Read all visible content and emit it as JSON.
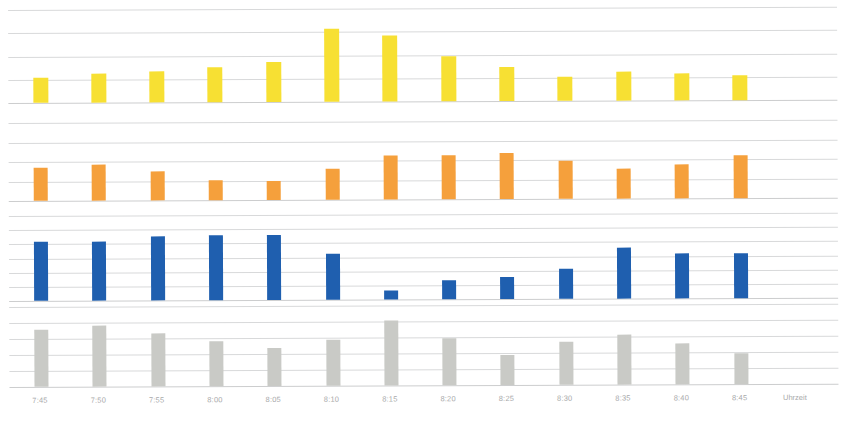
{
  "chart_data": {
    "type": "bar",
    "title": "",
    "subtitle": "",
    "xlabel": "Uhrzeit",
    "ylabel": "",
    "grid": true,
    "legend_position": "none",
    "orientation": "vertical",
    "panel_layout": "4 stacked panels sharing one time axis",
    "categories": [
      "7:45",
      "7:50",
      "7:55",
      "8:00",
      "8:05",
      "8:10",
      "8:15",
      "8:20",
      "8:25",
      "8:30",
      "8:35",
      "8:40",
      "8:45"
    ],
    "x_tick_labels": [
      "7:45",
      "7:50",
      "7:55",
      "8:00",
      "8:05",
      "8:10",
      "8:15",
      "8:20",
      "8:25",
      "8:30",
      "8:35",
      "8:40",
      "8:45"
    ],
    "series": [
      {
        "name": "Panel 1",
        "color": "#F7E033",
        "panel": 1,
        "ylim": [
          0,
          5
        ],
        "gridline_count": 4,
        "values": [
          1.35,
          1.55,
          1.65,
          1.9,
          2.15,
          3.9,
          3.55,
          2.4,
          1.85,
          1.3,
          1.55,
          1.45,
          1.35
        ]
      },
      {
        "name": "Panel 2",
        "color": "#F5A03C",
        "panel": 2,
        "ylim": [
          0,
          5
        ],
        "gridline_count": 4,
        "values": [
          2.1,
          2.3,
          1.85,
          1.3,
          1.2,
          2.0,
          2.85,
          2.85,
          2.95,
          2.45,
          1.95,
          2.2,
          2.75
        ]
      },
      {
        "name": "Panel 3",
        "color": "#1F5FAF",
        "panel": 3,
        "ylim": [
          0,
          7
        ],
        "gridline_count": 6,
        "values": [
          4.9,
          4.85,
          5.3,
          5.35,
          5.35,
          3.75,
          0.75,
          1.6,
          1.85,
          2.5,
          4.2,
          3.7,
          3.7
        ]
      },
      {
        "name": "Panel 4",
        "color": "#C9CAC6",
        "panel": 4,
        "ylim": [
          0,
          6
        ],
        "gridline_count": 5,
        "values": [
          4.3,
          4.55,
          3.95,
          3.4,
          2.85,
          3.45,
          4.85,
          3.5,
          2.25,
          3.2,
          3.75,
          3.05,
          2.35
        ]
      }
    ]
  },
  "axis": {
    "title": "Uhrzeit"
  },
  "colors": {
    "yellow": "#F7E033",
    "orange": "#F5A03C",
    "blue": "#1F5FAF",
    "gray": "#C9CAC6",
    "gridline": "#d8d9da",
    "tick_text": "#a8a9aa",
    "background": "#ffffff"
  }
}
